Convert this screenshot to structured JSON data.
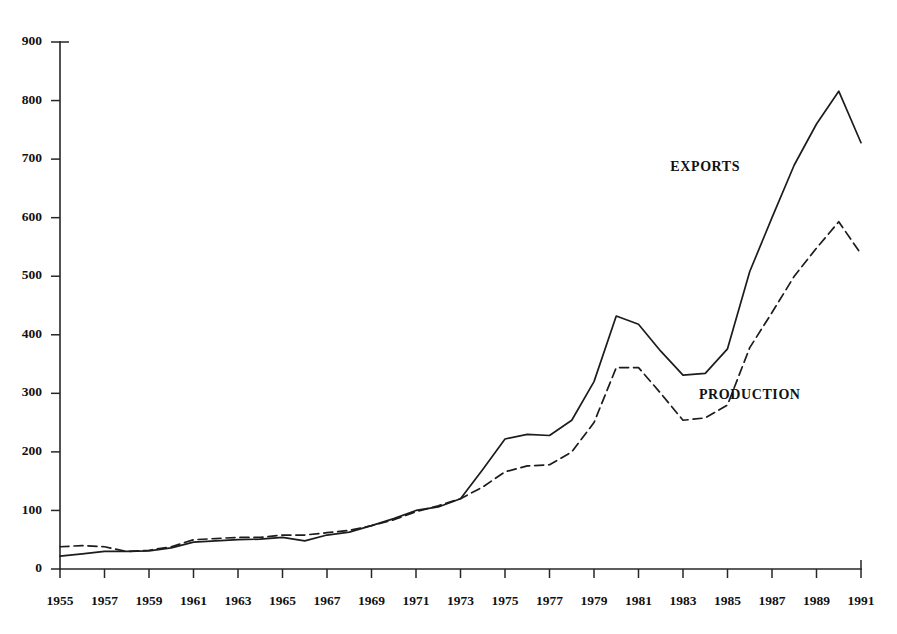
{
  "chart_data": {
    "type": "line",
    "title": "",
    "subtitle": "",
    "xlabel": "",
    "ylabel": "",
    "xlim": [
      1955,
      1991
    ],
    "ylim": [
      0,
      900
    ],
    "ytick_step": 100,
    "xtick_step": 2,
    "grid": false,
    "legend_position": "inline-annotation",
    "yticks": [
      0,
      100,
      200,
      300,
      400,
      500,
      600,
      700,
      800,
      900
    ],
    "ytick_labels": [
      "0",
      "100",
      "200",
      "300",
      "400",
      "500",
      "600",
      "700",
      "800",
      "900"
    ],
    "xticks": [
      1955,
      1957,
      1959,
      1961,
      1963,
      1965,
      1967,
      1969,
      1971,
      1973,
      1975,
      1977,
      1979,
      1981,
      1983,
      1985,
      1987,
      1989,
      1991
    ],
    "xtick_labels": [
      "1955",
      "1957",
      "1959",
      "1961",
      "1963",
      "1965",
      "1967",
      "1969",
      "1971",
      "1973",
      "1975",
      "1977",
      "1979",
      "1981",
      "1983",
      "1985",
      "1987",
      "1989",
      "1991"
    ],
    "x": [
      1955,
      1956,
      1957,
      1958,
      1959,
      1960,
      1961,
      1962,
      1963,
      1964,
      1965,
      1966,
      1967,
      1968,
      1969,
      1970,
      1971,
      1972,
      1973,
      1974,
      1975,
      1976,
      1977,
      1978,
      1979,
      1980,
      1981,
      1982,
      1983,
      1984,
      1985,
      1986,
      1987,
      1988,
      1989,
      1990,
      1991
    ],
    "series": [
      {
        "name": "EXPORTS",
        "style": "solid",
        "color": "#1c1c1c",
        "label_x": 1984,
        "label_y": 680,
        "values": [
          22,
          26,
          30,
          30,
          31,
          36,
          46,
          48,
          50,
          51,
          54,
          48,
          58,
          63,
          74,
          86,
          100,
          106,
          120,
          170,
          222,
          230,
          228,
          254,
          320,
          432,
          418,
          372,
          331,
          334,
          376,
          508,
          600,
          690,
          760,
          816,
          728
        ]
      },
      {
        "name": "PRODUCTION",
        "style": "dashed",
        "color": "#1c1c1c",
        "label_x": 1986,
        "label_y": 290,
        "values": [
          38,
          40,
          38,
          30,
          32,
          38,
          50,
          52,
          54,
          54,
          58,
          58,
          62,
          66,
          74,
          84,
          98,
          108,
          120,
          140,
          166,
          176,
          178,
          200,
          250,
          344,
          344,
          300,
          254,
          258,
          280,
          378,
          438,
          500,
          548,
          593,
          538
        ]
      }
    ]
  },
  "annotations": {
    "exports_label": "EXPORTS",
    "production_label": "PRODUCTION"
  }
}
